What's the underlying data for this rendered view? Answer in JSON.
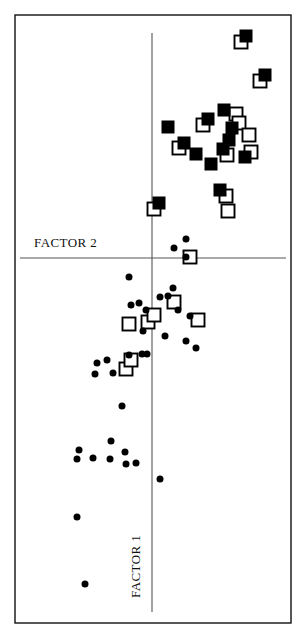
{
  "chart_data": {
    "type": "scatter",
    "title": "",
    "subtitle": "",
    "xlabel": "FACTOR 2",
    "ylabel": "FACTOR 1",
    "grid": false,
    "legend": "none",
    "annotations": [
      {
        "text": "FACTOR 2",
        "x": 34,
        "y": 247,
        "rotation": 0
      },
      {
        "text": "FACTOR 1",
        "x": 140,
        "y": 598,
        "rotation": -90
      }
    ],
    "axes": {
      "horizontal_line_y": 258,
      "vertical_line_x": 152,
      "vertical_line_top": 33,
      "vertical_line_bottom": 612,
      "horizontal_line_left": 20,
      "horizontal_line_right": 286,
      "origin": [
        152,
        258
      ]
    },
    "plot_frame": {
      "x": 15,
      "y": 15,
      "width": 276,
      "height": 608
    },
    "series": [
      {
        "name": "filled-square",
        "marker": "filled-square",
        "color": "#000000",
        "size": 13,
        "points": [
          [
            246,
            36
          ],
          [
            265,
            75
          ],
          [
            224,
            110
          ],
          [
            208,
            119
          ],
          [
            168,
            127
          ],
          [
            184,
            143
          ],
          [
            196,
            154
          ],
          [
            211,
            164
          ],
          [
            232,
            128
          ],
          [
            229,
            140
          ],
          [
            223,
            149
          ],
          [
            245,
            157
          ],
          [
            220,
            190
          ],
          [
            159,
            203
          ]
        ]
      },
      {
        "name": "open-square",
        "marker": "open-square",
        "color": "#000000",
        "size": 13,
        "points": [
          [
            241,
            42
          ],
          [
            260,
            81
          ],
          [
            236,
            114
          ],
          [
            203,
            125
          ],
          [
            179,
            148
          ],
          [
            239,
            123
          ],
          [
            249,
            135
          ],
          [
            227,
            155
          ],
          [
            251,
            152
          ],
          [
            226,
            196
          ],
          [
            228,
            211
          ],
          [
            154,
            209
          ],
          [
            190,
            257
          ],
          [
            174,
            302
          ],
          [
            198,
            320
          ],
          [
            129,
            324
          ],
          [
            148,
            322
          ],
          [
            154,
            315
          ],
          [
            126,
            369
          ],
          [
            131,
            360
          ]
        ]
      },
      {
        "name": "filled-circle",
        "marker": "filled-circle",
        "color": "#000000",
        "size": 7,
        "points": [
          [
            186,
            239
          ],
          [
            174,
            248
          ],
          [
            186,
            257
          ],
          [
            129,
            277
          ],
          [
            173,
            288
          ],
          [
            160,
            297
          ],
          [
            168,
            296
          ],
          [
            139,
            303
          ],
          [
            131,
            305
          ],
          [
            146,
            310
          ],
          [
            178,
            310
          ],
          [
            190,
            316
          ],
          [
            143,
            331
          ],
          [
            165,
            336
          ],
          [
            186,
            341
          ],
          [
            196,
            348
          ],
          [
            129,
            355
          ],
          [
            147,
            354
          ],
          [
            142,
            354
          ],
          [
            97,
            363
          ],
          [
            107,
            360
          ],
          [
            113,
            373
          ],
          [
            95,
            374
          ],
          [
            122,
            406
          ],
          [
            111,
            441
          ],
          [
            79,
            450
          ],
          [
            77,
            459
          ],
          [
            93,
            458
          ],
          [
            110,
            459
          ],
          [
            125,
            452
          ],
          [
            126,
            464
          ],
          [
            136,
            463
          ],
          [
            160,
            479
          ],
          [
            77,
            517
          ],
          [
            85,
            584
          ]
        ]
      }
    ]
  }
}
